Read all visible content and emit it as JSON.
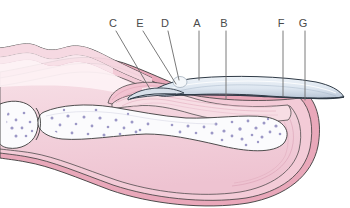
{
  "figure": {
    "background_color": "#ffffff",
    "width": 350,
    "height": 208
  },
  "palette": {
    "outline": "#3b3b3b",
    "label_color": "#4a4a4a",
    "leader_line_color": "#6b6b6b",
    "nail_plate_fill": "#dbe4ee",
    "nail_plate_fill_dark": "#c3cfdd",
    "nail_plate_edge": "#2f3a46",
    "skin_outer": "#e9a8ba",
    "skin_mid": "#f3cbd7",
    "dermis_pink": "#f6dbe3",
    "pulp_pink": "#f0c6d2",
    "nail_bed_pink": "#f7dde4",
    "bone_white": "#fbfbfd",
    "marrow_speck": "#8b86bd",
    "matrix_pink": "#f2c3d1",
    "pale_tissue": "#fdf1f4"
  },
  "labels": [
    {
      "id": "C",
      "text": "C",
      "x": 113,
      "y": 27,
      "leader": {
        "x1": 116,
        "y1": 31,
        "x2": 150,
        "y2": 89
      },
      "target": "nail-matrix"
    },
    {
      "id": "E",
      "text": "E",
      "x": 140,
      "y": 27,
      "leader": {
        "x1": 143,
        "y1": 31,
        "x2": 176,
        "y2": 84
      },
      "target": "eponychium"
    },
    {
      "id": "D",
      "text": "D",
      "x": 165,
      "y": 27,
      "leader": {
        "x1": 168,
        "y1": 31,
        "x2": 179,
        "y2": 80
      },
      "target": "nail-root-cuticle"
    },
    {
      "id": "A",
      "text": "A",
      "x": 197,
      "y": 27,
      "leader": {
        "x1": 199,
        "y1": 31,
        "x2": 199,
        "y2": 80
      },
      "target": "nail-plate"
    },
    {
      "id": "B",
      "text": "B",
      "x": 224,
      "y": 27,
      "leader": {
        "x1": 226,
        "y1": 31,
        "x2": 226,
        "y2": 99
      },
      "target": "nail-bed"
    },
    {
      "id": "F",
      "text": "F",
      "x": 281,
      "y": 27,
      "leader": {
        "x1": 283,
        "y1": 31,
        "x2": 283,
        "y2": 96
      },
      "target": "free-edge-hyponychium"
    },
    {
      "id": "G",
      "text": "G",
      "x": 303,
      "y": 27,
      "leader": {
        "x1": 305,
        "y1": 31,
        "x2": 305,
        "y2": 100
      },
      "target": "distal-skin-fold"
    }
  ],
  "structures": {
    "nail_plate": "nail-plate",
    "nail_bed": "nail-bed",
    "nail_matrix": "nail-matrix",
    "distal_phalanx_bone": "distal-phalanx-bone",
    "joint_bone": "proximal-bone",
    "fingertip_pulp": "fingertip-pulp",
    "dorsal_skin": "dorsal-skin"
  }
}
